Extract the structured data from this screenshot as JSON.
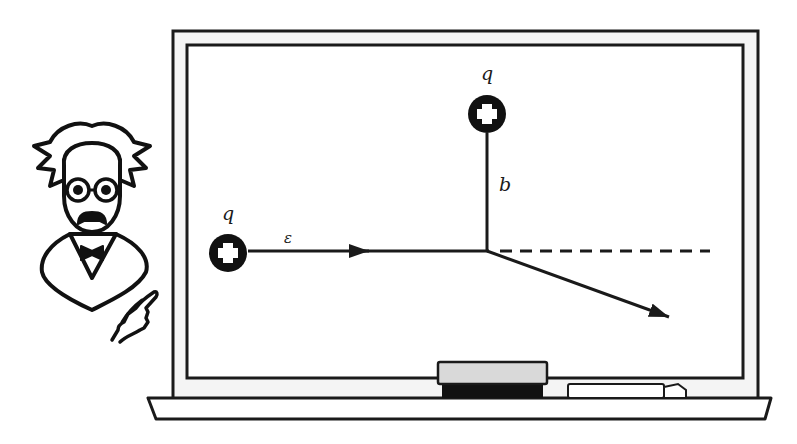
{
  "diagram": {
    "colors": {
      "ink": "#1a1a1a",
      "board": "#ffffff",
      "frame_gap": "#f4f4f4",
      "eraser_top": "#d9d9d9",
      "eraser_base": "#111111",
      "chalk": "#ffffff"
    },
    "labels": {
      "incoming_charge": "q",
      "target_charge": "q",
      "energy": "ε",
      "impact_parameter": "b"
    },
    "elements": {
      "incoming_charge": {
        "symbol": "plus",
        "center": [
          228,
          253
        ],
        "radius": 19
      },
      "target_charge": {
        "symbol": "plus",
        "center": [
          487,
          114
        ],
        "radius": 19
      },
      "incoming_path": {
        "from": [
          248,
          251
        ],
        "to": [
          487,
          251
        ],
        "arrow_at": 367
      },
      "impact_line": {
        "from": [
          487,
          133
        ],
        "to": [
          487,
          251
        ]
      },
      "undeflected_path": {
        "style": "dashed",
        "from": [
          500,
          251
        ],
        "to": [
          708,
          251
        ]
      },
      "deflected_path": {
        "from": [
          487,
          251
        ],
        "to": [
          669,
          317
        ]
      }
    },
    "props": [
      "blackboard",
      "eraser",
      "chalk",
      "professor-character",
      "pointing-hand"
    ]
  }
}
